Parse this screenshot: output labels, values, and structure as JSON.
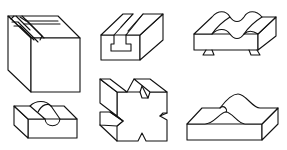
{
  "figure": {
    "background": "#ffffff",
    "stroke_color": "#111111",
    "shapes": [
      {
        "id": "cube-with-stepped-grooves",
        "position": "top-left"
      },
      {
        "id": "block-with-t-slot",
        "position": "top-center"
      },
      {
        "id": "block-with-wavy-top-and-dovetail-base",
        "position": "top-right"
      },
      {
        "id": "block-with-semicircular-groove",
        "position": "bottom-left"
      },
      {
        "id": "cross-shaped-block-with-v-notches",
        "position": "bottom-center"
      },
      {
        "id": "slab-with-curved-hump",
        "position": "bottom-right"
      }
    ]
  }
}
